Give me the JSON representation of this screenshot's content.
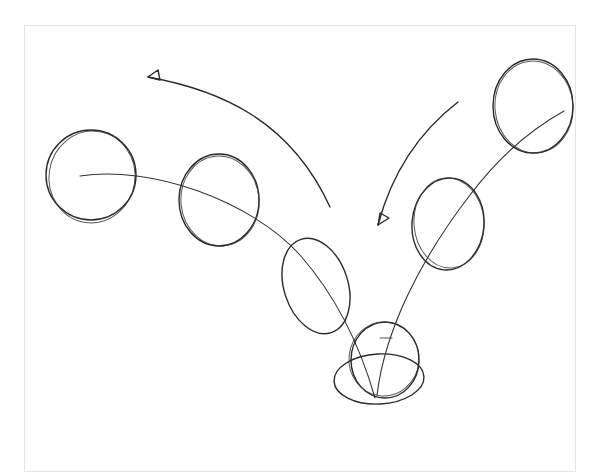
{
  "sketch": {
    "subject": "bouncing ball arc animation sketch",
    "ink_color": "#2a2a2a",
    "paper_color": "#ffffff",
    "frame_border_color": "#e4e4e4",
    "balls": [
      {
        "id": "ball-1",
        "cx": 91,
        "cy": 175,
        "rx": 45,
        "ry": 45,
        "shape": "circle"
      },
      {
        "id": "ball-2",
        "cx": 219,
        "cy": 200,
        "rx": 40,
        "ry": 46,
        "shape": "circle"
      },
      {
        "id": "ball-3",
        "cx": 316,
        "cy": 286,
        "rx": 33,
        "ry": 49,
        "shape": "stretched-ellipse"
      },
      {
        "id": "ball-4-contact",
        "cx": 384,
        "cy": 360,
        "rx": 34,
        "ry": 38,
        "shape": "circle"
      },
      {
        "id": "ball-4-squash",
        "cx": 379,
        "cy": 378,
        "rx": 45,
        "ry": 27,
        "shape": "squashed-ellipse"
      },
      {
        "id": "ball-5",
        "cx": 448,
        "cy": 224,
        "rx": 36,
        "ry": 46,
        "shape": "stretched-ellipse"
      },
      {
        "id": "ball-6",
        "cx": 533,
        "cy": 106,
        "rx": 40,
        "ry": 47,
        "shape": "circle"
      }
    ],
    "arrows": [
      {
        "id": "arrow-left",
        "direction": "up-left",
        "label": ""
      },
      {
        "id": "arrow-right",
        "direction": "down-left",
        "label": ""
      }
    ]
  }
}
